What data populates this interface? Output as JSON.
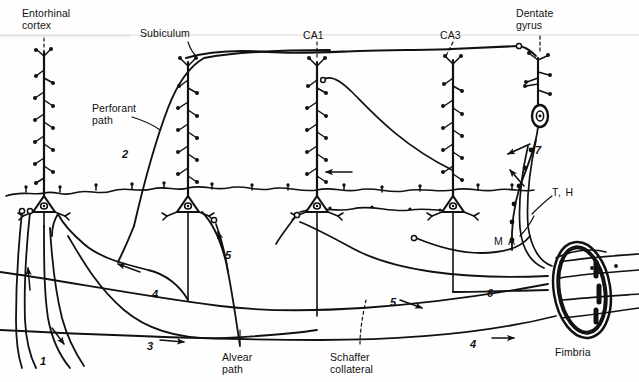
{
  "figure": {
    "background_color": "#fefefe",
    "ink_color": "#111111"
  },
  "region_labels": [
    {
      "id": "entorhinal-cortex",
      "text": "Entorhinal\ncortex",
      "x": 22,
      "y": 8,
      "leader": "dashed"
    },
    {
      "id": "subiculum",
      "text": "Subiculum",
      "x": 140,
      "y": 28,
      "leader": "solid"
    },
    {
      "id": "ca1",
      "text": "CA1",
      "x": 303,
      "y": 30,
      "leader": "dashed"
    },
    {
      "id": "ca3",
      "text": "CA3",
      "x": 440,
      "y": 30,
      "leader": "dashed"
    },
    {
      "id": "dentate-gyrus",
      "text": "Dentate\ngyrus",
      "x": 516,
      "y": 8,
      "leader": "dashed"
    }
  ],
  "pathway_labels": [
    {
      "id": "perforant-path",
      "text": "Perforant\npath",
      "x": 92,
      "y": 103,
      "leader": "solid"
    },
    {
      "id": "alvear-path",
      "text": "Alvear\npath",
      "x": 222,
      "y": 352,
      "leader": "solid"
    },
    {
      "id": "schaffer-collateral",
      "text": "Schaffer\ncollateral",
      "x": 330,
      "y": 352,
      "leader": "dashed"
    },
    {
      "id": "fimbria",
      "text": "Fimbria",
      "x": 555,
      "y": 347,
      "leader": "none"
    },
    {
      "id": "mossy-associational",
      "text": "M A",
      "x": 494,
      "y": 236,
      "leader": "solid"
    },
    {
      "id": "temporoammonic-hilar",
      "text": "T, H",
      "x": 552,
      "y": 187,
      "leader": "solid"
    }
  ],
  "numbered_markers": [
    {
      "id": "marker-1",
      "label": "1",
      "x": 40,
      "y": 355,
      "arrow": "down-right"
    },
    {
      "id": "marker-2",
      "label": "2",
      "x": 122,
      "y": 148,
      "arrow": "up"
    },
    {
      "id": "marker-3",
      "label": "3",
      "x": 147,
      "y": 340,
      "arrow": "right"
    },
    {
      "id": "marker-4",
      "label": "4",
      "x": 152,
      "y": 288,
      "arrow": "left"
    },
    {
      "id": "marker-5",
      "label": "5",
      "x": 225,
      "y": 249,
      "arrow": "up"
    },
    {
      "id": "marker-5b",
      "label": "5",
      "x": 390,
      "y": 296,
      "arrow": "right-down"
    },
    {
      "id": "marker-4b",
      "label": "4",
      "x": 470,
      "y": 338,
      "arrow": "right"
    },
    {
      "id": "marker-6",
      "label": "6",
      "x": 487,
      "y": 287,
      "arrow": "right"
    },
    {
      "id": "marker-7",
      "label": "7",
      "x": 535,
      "y": 144,
      "arrow": "left-down"
    }
  ],
  "neurons": [
    {
      "id": "entorhinal-pyramidal",
      "x": 44,
      "soma_y": 207,
      "apical_top": 52,
      "type": "pyramidal"
    },
    {
      "id": "subiculum-pyramidal",
      "x": 188,
      "soma_y": 207,
      "apical_top": 58,
      "type": "pyramidal"
    },
    {
      "id": "ca1-pyramidal",
      "x": 317,
      "soma_y": 207,
      "apical_top": 58,
      "type": "pyramidal"
    },
    {
      "id": "ca3-pyramidal",
      "x": 453,
      "soma_y": 207,
      "apical_top": 58,
      "type": "pyramidal"
    },
    {
      "id": "dentate-granule",
      "x": 538,
      "soma_y": 115,
      "apical_top": 55,
      "type": "granule"
    }
  ]
}
